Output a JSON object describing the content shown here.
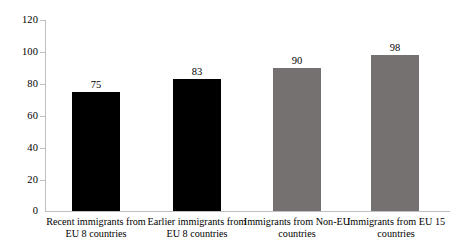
{
  "chart_data": {
    "type": "bar",
    "title": "",
    "subtitle": "",
    "xlabel": "",
    "ylabel": "",
    "ylim": [
      0,
      120
    ],
    "ytick_step": 20,
    "yticks": [
      0,
      20,
      40,
      60,
      80,
      100,
      120
    ],
    "ytick_labels": [
      "0",
      "20",
      "40",
      "60",
      "80",
      "100",
      "120"
    ],
    "grid": false,
    "legend": false,
    "legend_position": "none",
    "categories": [
      "Recent immigrants from EU 8 countries",
      "Earlier immigrants from EU 8 countries",
      "Immigrants from Non-EU countries",
      "Immigrants from EU 15 countries"
    ],
    "category_lines": [
      [
        "Recent immigrants from",
        "EU 8 countries"
      ],
      [
        "Earlier immigrants from",
        "EU 8 countries"
      ],
      [
        "Immigrants from Non-EU",
        "countries"
      ],
      [
        "Immigrants from EU 15",
        "countries"
      ]
    ],
    "values": [
      75,
      83,
      90,
      98
    ],
    "value_labels": [
      "75",
      "83",
      "90",
      "98"
    ],
    "bar_colors": [
      "#000000",
      "#000000",
      "#767171",
      "#767171"
    ],
    "axis_color": "#bfbfbf",
    "background_color": "#ffffff"
  }
}
